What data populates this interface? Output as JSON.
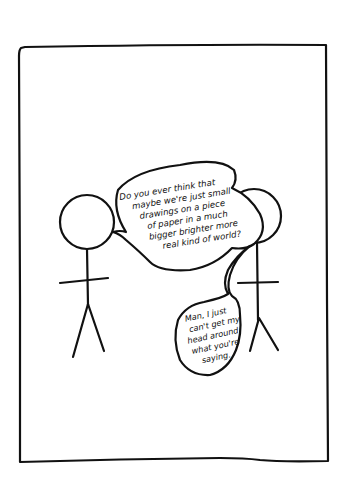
{
  "comic": {
    "panel_count": 1,
    "characters": [
      {
        "id": "left-stick-figure",
        "role": "speaker"
      },
      {
        "id": "right-stick-figure",
        "role": "listener"
      }
    ],
    "speech_bubbles": [
      {
        "speaker": "left-stick-figure",
        "lines": [
          "Do you ever think that",
          "maybe we're just small",
          "drawings on a piece",
          "of paper in a much",
          "bigger brighter more",
          "real kind of world?"
        ]
      },
      {
        "speaker": "right-stick-figure",
        "lines": [
          "Man, I just",
          "can't get my",
          "head around",
          "what you're",
          "saying."
        ]
      }
    ],
    "colors": {
      "ink": "#111111",
      "paper": "#ffffff"
    }
  }
}
